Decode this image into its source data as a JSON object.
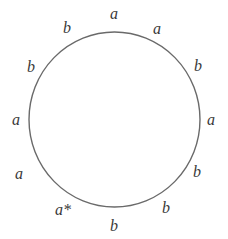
{
  "diagram": {
    "type": "labeled-cycle",
    "circle": {
      "center_x": 114.5,
      "center_y": 119.5,
      "radius_x": 85.5,
      "radius_y": 87.5,
      "stroke_color": "#6a6a6a",
      "stroke_width": 1.4,
      "fill": "none"
    },
    "background_color": "#ffffff",
    "label_color": "#3a3a3a",
    "labels": [
      {
        "text": "a",
        "x": 114,
        "y": 14,
        "name": "label-top-a"
      },
      {
        "text": "a",
        "x": 157,
        "y": 29,
        "name": "label-upper-right-a"
      },
      {
        "text": "b",
        "x": 198,
        "y": 66,
        "name": "label-right-upper-b"
      },
      {
        "text": "a",
        "x": 211,
        "y": 120,
        "name": "label-right-a"
      },
      {
        "text": "b",
        "x": 197,
        "y": 172,
        "name": "label-right-lower-b"
      },
      {
        "text": "b",
        "x": 166,
        "y": 208,
        "name": "label-lower-right-b"
      },
      {
        "text": "b",
        "x": 114,
        "y": 226,
        "name": "label-bottom-b"
      },
      {
        "text": "a*",
        "x": 63,
        "y": 210,
        "name": "label-bottom-left-a-star"
      },
      {
        "text": "a",
        "x": 19,
        "y": 174,
        "name": "label-left-lower-a"
      },
      {
        "text": "a",
        "x": 16,
        "y": 120,
        "name": "label-left-a"
      },
      {
        "text": "b",
        "x": 31,
        "y": 67,
        "name": "label-left-upper-b"
      },
      {
        "text": "b",
        "x": 67,
        "y": 28,
        "name": "label-upper-left-b"
      }
    ]
  }
}
